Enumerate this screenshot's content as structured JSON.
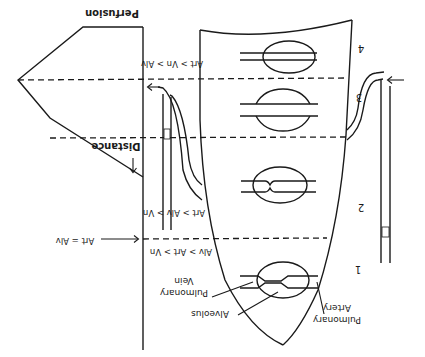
{
  "figure": {
    "orientation": "rotated 180 degrees",
    "perfusion_axis_label": "Perfusion",
    "distance_axis_label": "Distance",
    "zones": [
      {
        "number": "1",
        "label": "1",
        "pressure_relation": "Alv > Art > Vn"
      },
      {
        "number": "2",
        "label": "2",
        "pressure_relation": "Art > Alv > Vn"
      },
      {
        "number": "3",
        "label": "3",
        "pressure_relation": "Art > Vn > Alv"
      },
      {
        "number": "4",
        "label": "4",
        "pressure_relation": ""
      }
    ],
    "boundary_annotation": "Art = Alv",
    "structure_labels": {
      "alveolus": "Alveolus",
      "pulmonary_vein": "Pulmonary\nVein",
      "pulmonary_vein_line1": "Pulmonary",
      "pulmonary_vein_line2": "Vein",
      "pulmonary_artery_line1": "Pulmonary",
      "pulmonary_artery_line2": "Artery"
    },
    "relations": {
      "zone1": "Alv > Art > Vn",
      "zone2": "Art > Alv > Vn",
      "zone3": "Art > Vn > Alv",
      "boundary12": "Art = Alv"
    },
    "colors": {
      "ink": "#1a1a1a",
      "background": "#ffffff"
    }
  }
}
